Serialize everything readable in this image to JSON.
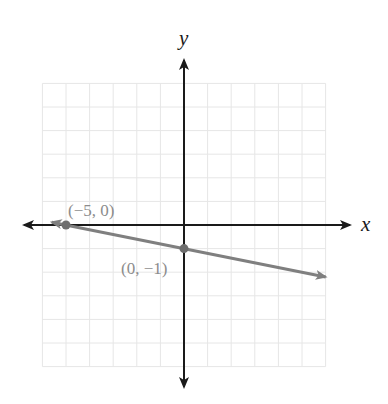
{
  "chart_data": {
    "type": "line",
    "title": "",
    "xlabel": "x",
    "ylabel": "y",
    "xlim": [
      -6,
      6
    ],
    "ylim": [
      -6,
      6
    ],
    "grid": true,
    "grid_step": 1,
    "tick_labels_shown": false,
    "series": [
      {
        "name": "line",
        "equation": "y = -x/5 - 1",
        "slope": -0.2,
        "intercept": -1,
        "x": [
          -5.6,
          6.0
        ],
        "y": [
          0.12,
          -2.2
        ],
        "arrows_both_ends": true,
        "color": "#7f7f7f"
      }
    ],
    "points": [
      {
        "x": -5,
        "y": 0,
        "label": "(−5, 0)",
        "label_position": "above-right"
      },
      {
        "x": 0,
        "y": -1,
        "label": "(0, −1)",
        "label_position": "below-left"
      }
    ]
  },
  "colors": {
    "axis": "#1a1a1a",
    "grid": "#e6e6e6",
    "line": "#7f7f7f",
    "point": "#6e6e6e",
    "label": "#8c8c8c"
  },
  "labels": {
    "x_axis": "x",
    "y_axis": "y",
    "point_a": "(−5, 0)",
    "point_b": "(0, −1)"
  }
}
